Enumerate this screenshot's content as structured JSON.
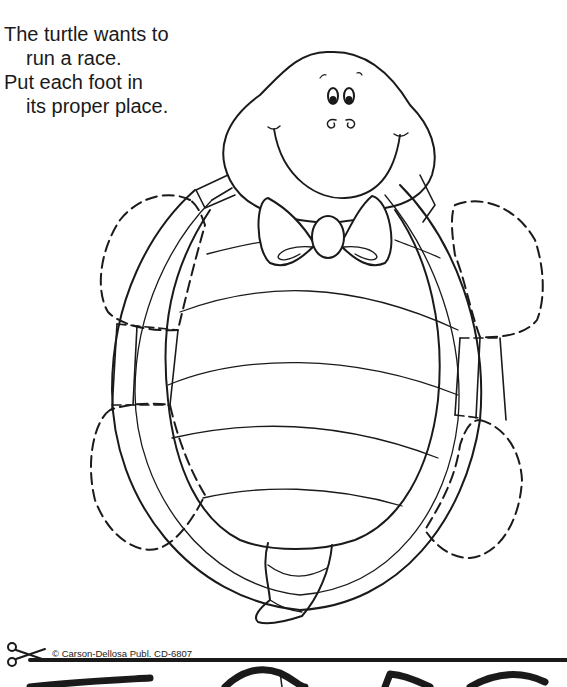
{
  "poem": {
    "lines": [
      "The turtle wants to",
      "run a race.",
      "Put each foot in",
      "its proper place."
    ]
  },
  "illustration": {
    "subject": "turtle-with-bow-tie",
    "feet_count": 4,
    "feet_style": "dashed cut-out outline",
    "line_color": "#1a1a1a"
  },
  "cut_line": {
    "icon": "scissors-icon",
    "credit": "© Carson-Dellosa Publ. CD-6807"
  }
}
